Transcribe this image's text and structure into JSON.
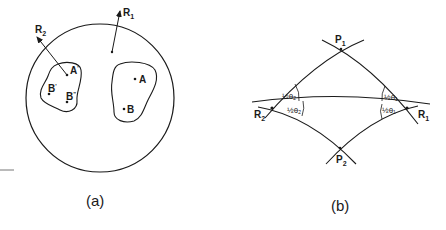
{
  "panel_a": {
    "caption": "(a)",
    "vectors": [
      {
        "label": "R",
        "sub": "1"
      },
      {
        "label": "R",
        "sub": "2"
      }
    ],
    "points": [
      {
        "label": "A",
        "sup": ""
      },
      {
        "label": "B",
        "sup": ""
      },
      {
        "label": "A",
        "sup": "'"
      },
      {
        "label": "B",
        "sup": "'"
      },
      {
        "label": "B",
        "sup": "\""
      }
    ]
  },
  "panel_b": {
    "caption": "(b)",
    "vertices": [
      {
        "label": "P",
        "sub": "1"
      },
      {
        "label": "P",
        "sub": "2"
      },
      {
        "label": "R",
        "sub": "1"
      },
      {
        "label": "R",
        "sub": "2"
      }
    ],
    "angles": {
      "r2_upper": "½θ₂",
      "r2_lower": "½θ₂",
      "r1_upper": "½θ₁",
      "r1_lower": "½θ₁"
    }
  },
  "colors": {
    "ink": "#1a1a1a",
    "background": "#ffffff"
  }
}
